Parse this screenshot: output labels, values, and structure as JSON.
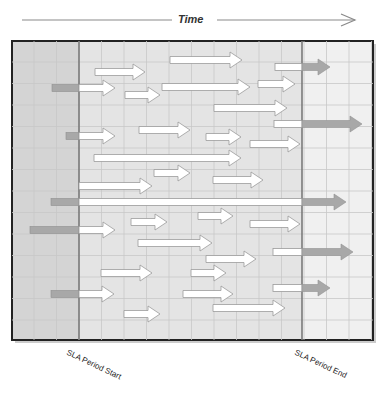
{
  "header": {
    "time_label": "Time"
  },
  "labels": {
    "sla_start": "SLA Period Start",
    "sla_end": "SLA Period End"
  },
  "colors": {
    "background_out": "#d4d4d4",
    "background_in": "#e4e4e4",
    "background_after": "#f0f0f0",
    "grid": "#c8c8c8",
    "frame": "#222222",
    "sla_line": "#7a7a7a",
    "arrow_white": "#ffffff",
    "arrow_outline": "#9a9a9a",
    "arrow_gray": "#a8a8a8"
  },
  "layout": {
    "frame": {
      "x": 12,
      "y": 41,
      "w": 361,
      "h": 299
    },
    "sla_start_x": 79,
    "sla_end_x": 302
  },
  "arrows": [
    {
      "y": 60,
      "x1": 170,
      "x2": 242,
      "pre": null,
      "post": null
    },
    {
      "y": 72,
      "x1": 95,
      "x2": 145,
      "pre": null,
      "post": null
    },
    {
      "y": 67,
      "x1": 275,
      "x2": 302,
      "pre": null,
      "post": 330
    },
    {
      "y": 88,
      "x1": 79,
      "x2": 115,
      "pre": 52,
      "post": null
    },
    {
      "y": 87,
      "x1": 162,
      "x2": 250,
      "pre": null,
      "post": null
    },
    {
      "y": 95,
      "x1": 125,
      "x2": 160,
      "pre": null,
      "post": null
    },
    {
      "y": 84,
      "x1": 258,
      "x2": 295,
      "pre": null,
      "post": null
    },
    {
      "y": 108,
      "x1": 214,
      "x2": 287,
      "pre": null,
      "post": null
    },
    {
      "y": 124,
      "x1": 274,
      "x2": 302,
      "pre": null,
      "post": 362
    },
    {
      "y": 136,
      "x1": 79,
      "x2": 115,
      "pre": 66,
      "post": null
    },
    {
      "y": 130,
      "x1": 139,
      "x2": 190,
      "pre": null,
      "post": null
    },
    {
      "y": 137,
      "x1": 206,
      "x2": 241,
      "pre": null,
      "post": null
    },
    {
      "y": 144,
      "x1": 250,
      "x2": 300,
      "pre": null,
      "post": null
    },
    {
      "y": 158,
      "x1": 94,
      "x2": 241,
      "pre": null,
      "post": null
    },
    {
      "y": 173,
      "x1": 154,
      "x2": 190,
      "pre": null,
      "post": null
    },
    {
      "y": 180,
      "x1": 213,
      "x2": 263,
      "pre": null,
      "post": null
    },
    {
      "y": 186,
      "x1": 79,
      "x2": 152,
      "pre": null,
      "post": null
    },
    {
      "y": 202,
      "x1": 79,
      "x2": 302,
      "pre": 51,
      "post": 346
    },
    {
      "y": 222,
      "x1": 131,
      "x2": 167,
      "pre": null,
      "post": null
    },
    {
      "y": 216,
      "x1": 198,
      "x2": 233,
      "pre": null,
      "post": null
    },
    {
      "y": 224,
      "x1": 250,
      "x2": 300,
      "pre": null,
      "post": null
    },
    {
      "y": 230,
      "x1": 79,
      "x2": 115,
      "pre": 30,
      "post": null
    },
    {
      "y": 243,
      "x1": 138,
      "x2": 212,
      "pre": null,
      "post": null
    },
    {
      "y": 259,
      "x1": 206,
      "x2": 256,
      "pre": null,
      "post": null
    },
    {
      "y": 252,
      "x1": 273,
      "x2": 302,
      "pre": null,
      "post": 353
    },
    {
      "y": 273,
      "x1": 101,
      "x2": 152,
      "pre": null,
      "post": null
    },
    {
      "y": 273,
      "x1": 191,
      "x2": 226,
      "pre": null,
      "post": null
    },
    {
      "y": 294,
      "x1": 183,
      "x2": 233,
      "pre": null,
      "post": null
    },
    {
      "y": 288,
      "x1": 273,
      "x2": 302,
      "pre": null,
      "post": 330
    },
    {
      "y": 294,
      "x1": 79,
      "x2": 114,
      "pre": 51,
      "post": null
    },
    {
      "y": 314,
      "x1": 124,
      "x2": 160,
      "pre": null,
      "post": null
    },
    {
      "y": 308,
      "x1": 213,
      "x2": 285,
      "pre": null,
      "post": null
    }
  ]
}
